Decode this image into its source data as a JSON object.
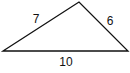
{
  "diagram": {
    "type": "triangle",
    "vertices": {
      "apex": [
        79,
        2
      ],
      "left": [
        3,
        51
      ],
      "right": [
        128,
        51
      ]
    },
    "sides": [
      {
        "name": "left-side",
        "label": "7",
        "from": "left",
        "to": "apex",
        "label_pos": [
          36,
          23
        ]
      },
      {
        "name": "right-side",
        "label": "6",
        "from": "apex",
        "to": "right",
        "label_pos": [
          110,
          25
        ]
      },
      {
        "name": "base",
        "label": "10",
        "from": "left",
        "to": "right",
        "label_pos": [
          66,
          66
        ]
      }
    ],
    "stroke_color": "#111111",
    "background": "#ffffff"
  }
}
